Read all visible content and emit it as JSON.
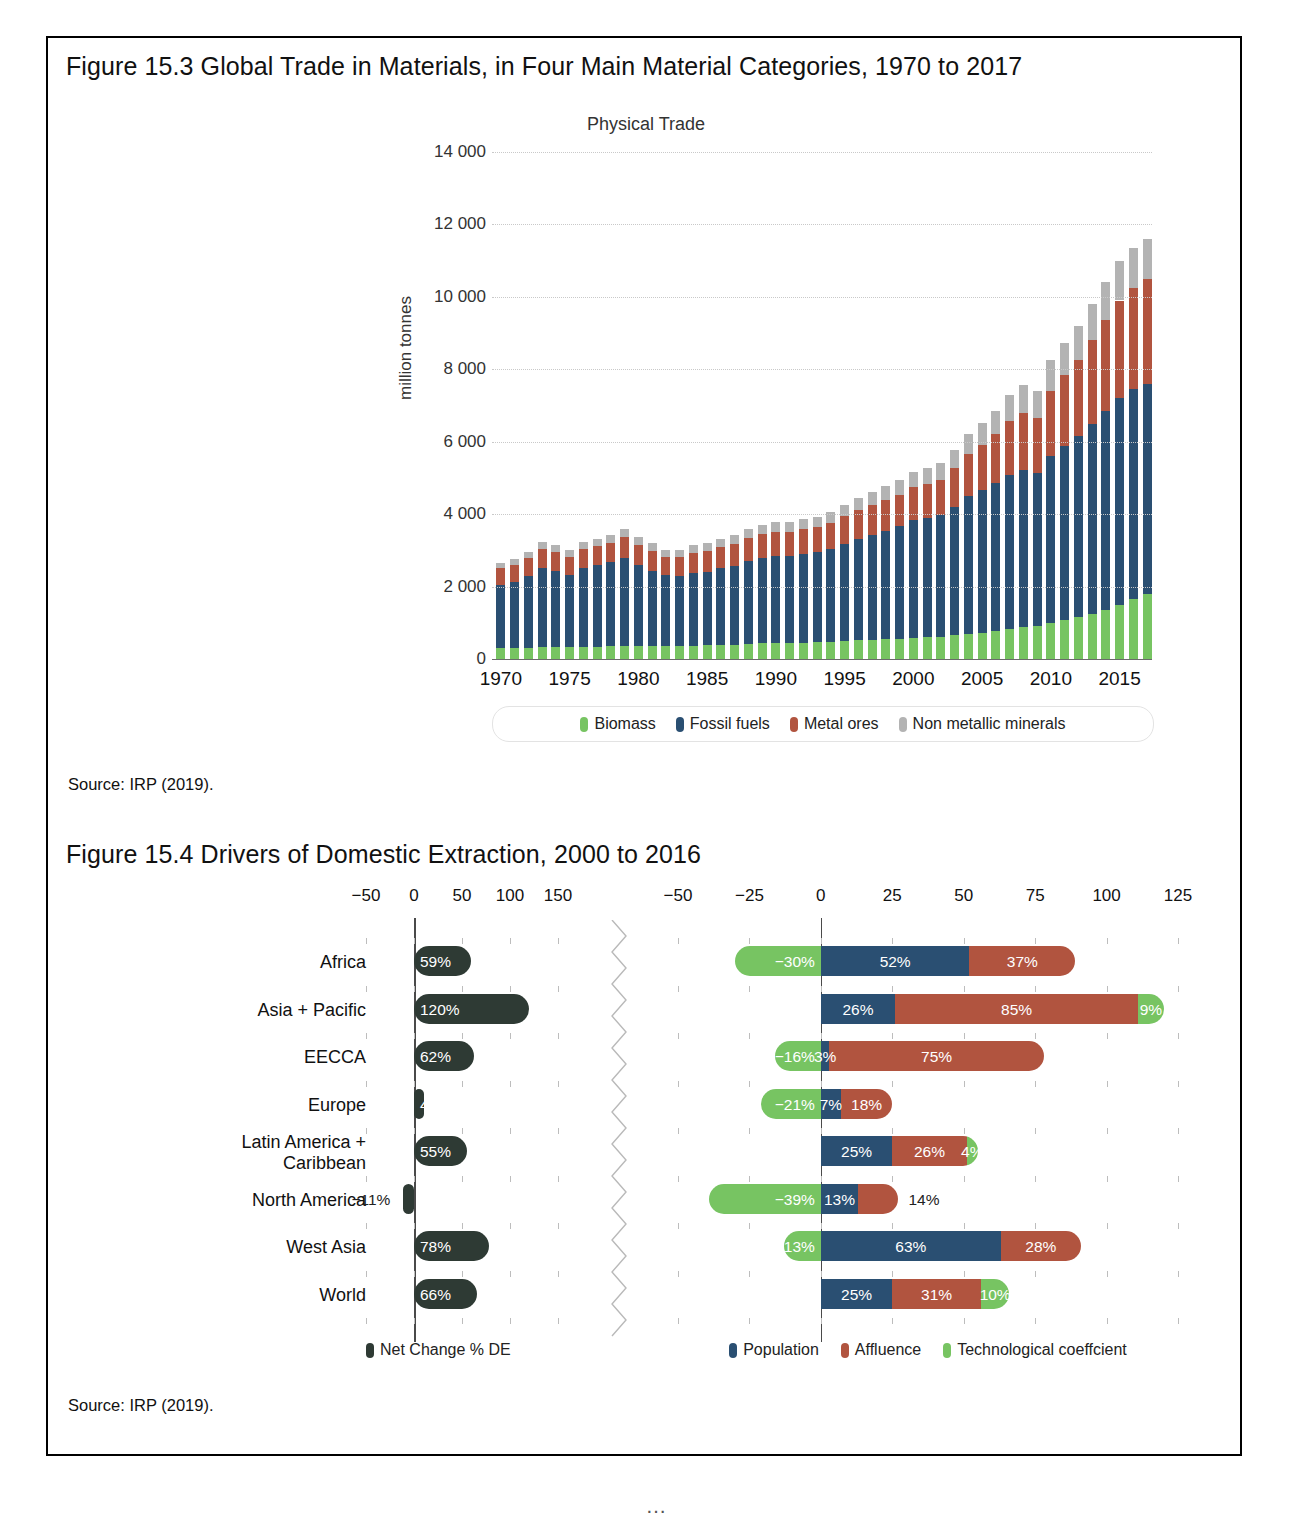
{
  "figure_3": {
    "title": "Figure 15.3  Global Trade in Materials, in Four Main Material Categories, 1970 to 2017",
    "source": "Source: IRP (2019)."
  },
  "figure_4": {
    "title": "Figure 15.4  Drivers of Domestic Extraction, 2000 to 2016",
    "source": "Source: IRP (2019)."
  },
  "chart_data": [
    {
      "type": "bar",
      "stacked": true,
      "title": "Physical Trade",
      "xlabel": "",
      "ylabel": "million tonnes",
      "ylim": [
        0,
        14000
      ],
      "yticks": [
        "0",
        "2 000",
        "4 000",
        "6 000",
        "8 000",
        "10 000",
        "12 000",
        "14 000"
      ],
      "xticks": [
        "1970",
        "1975",
        "1980",
        "1985",
        "1990",
        "1995",
        "2000",
        "2005",
        "2010",
        "2015"
      ],
      "grid": true,
      "legend_position": "bottom",
      "legend": [
        "Biomass",
        "Fossil fuels",
        "Metal ores",
        "Non metallic minerals"
      ],
      "colors": {
        "Biomass": "#77c462",
        "Fossil fuels": "#2a4f72",
        "Metal ores": "#b1543f",
        "Non metallic minerals": "#b3b3b3"
      },
      "x": [
        1970,
        1971,
        1972,
        1973,
        1974,
        1975,
        1976,
        1977,
        1978,
        1979,
        1980,
        1981,
        1982,
        1983,
        1984,
        1985,
        1986,
        1987,
        1988,
        1989,
        1990,
        1991,
        1992,
        1993,
        1994,
        1995,
        1996,
        1997,
        1998,
        1999,
        2000,
        2001,
        2002,
        2003,
        2004,
        2005,
        2006,
        2007,
        2008,
        2009,
        2010,
        2011,
        2012,
        2013,
        2014,
        2015,
        2016,
        2017
      ],
      "series": [
        {
          "name": "Biomass",
          "values": [
            300,
            305,
            315,
            330,
            325,
            320,
            335,
            345,
            355,
            365,
            360,
            355,
            350,
            355,
            370,
            375,
            390,
            400,
            420,
            430,
            440,
            450,
            455,
            465,
            480,
            500,
            515,
            530,
            545,
            560,
            580,
            600,
            620,
            650,
            690,
            720,
            760,
            820,
            880,
            900,
            1000,
            1080,
            1150,
            1250,
            1350,
            1500,
            1650,
            1800
          ]
        },
        {
          "name": "Fossil fuels",
          "values": [
            1750,
            1830,
            1980,
            2180,
            2100,
            2010,
            2180,
            2250,
            2320,
            2430,
            2230,
            2080,
            1960,
            1950,
            2000,
            2030,
            2120,
            2180,
            2280,
            2350,
            2400,
            2400,
            2450,
            2480,
            2560,
            2680,
            2800,
            2900,
            3000,
            3100,
            3250,
            3300,
            3350,
            3550,
            3800,
            3950,
            4100,
            4250,
            4350,
            4250,
            4600,
            4800,
            5000,
            5250,
            5500,
            5700,
            5800,
            5800
          ]
        },
        {
          "name": "Metal ores",
          "values": [
            450,
            470,
            490,
            520,
            520,
            480,
            510,
            520,
            540,
            570,
            560,
            540,
            500,
            510,
            550,
            570,
            580,
            600,
            640,
            660,
            670,
            670,
            680,
            690,
            720,
            760,
            790,
            830,
            850,
            880,
            920,
            940,
            980,
            1080,
            1180,
            1250,
            1350,
            1500,
            1550,
            1500,
            1800,
            1950,
            2100,
            2300,
            2500,
            2700,
            2800,
            2900
          ]
        },
        {
          "name": "Non metallic minerals",
          "values": [
            160,
            170,
            180,
            200,
            200,
            190,
            200,
            210,
            220,
            230,
            225,
            215,
            205,
            205,
            215,
            220,
            230,
            240,
            250,
            260,
            270,
            270,
            280,
            290,
            300,
            320,
            340,
            360,
            380,
            400,
            420,
            430,
            450,
            500,
            550,
            600,
            650,
            720,
            780,
            760,
            850,
            900,
            950,
            1000,
            1050,
            1080,
            1100,
            1100
          ]
        }
      ]
    },
    {
      "type": "bar",
      "orientation": "horizontal",
      "panel": "left",
      "title": "",
      "legend": [
        "Net Change % DE"
      ],
      "colors": {
        "Net Change % DE": "#2e3a34"
      },
      "xticks": [
        "-50",
        "0",
        "50",
        "100",
        "150"
      ],
      "xlim": [
        -50,
        150
      ],
      "categories": [
        "Africa",
        "Asia + Pacific",
        "EECCA",
        "Europe",
        "Latin America + Caribbean",
        "North America",
        "West Asia",
        "World"
      ],
      "values": [
        59,
        120,
        62,
        4,
        55,
        -11,
        78,
        66
      ],
      "labels": [
        "59%",
        "120%",
        "62%",
        "4%",
        "55%",
        "-11%",
        "78%",
        "66%"
      ]
    },
    {
      "type": "bar",
      "orientation": "horizontal",
      "stacked": true,
      "panel": "right",
      "title": "",
      "legend": [
        "Population",
        "Affluence",
        "Technological coeffcient"
      ],
      "colors": {
        "Population": "#2a4f72",
        "Affluence": "#b1543f",
        "Technological coeffcient": "#77c462"
      },
      "xticks": [
        "-50",
        "-25",
        "0",
        "25",
        "50",
        "75",
        "100",
        "125"
      ],
      "xlim": [
        -50,
        125
      ],
      "categories": [
        "Africa",
        "Asia + Pacific",
        "EECCA",
        "Europe",
        "Latin America + Caribbean",
        "North America",
        "West Asia",
        "World"
      ],
      "series": [
        {
          "name": "Population",
          "values": [
            52,
            26,
            3,
            7,
            25,
            13,
            63,
            25
          ],
          "labels": [
            "52%",
            "26%",
            "3%",
            "7%",
            "25%",
            "13%",
            "63%",
            "25%"
          ]
        },
        {
          "name": "Affluence",
          "values": [
            37,
            85,
            75,
            18,
            26,
            14,
            28,
            31
          ],
          "labels": [
            "37%",
            "85%",
            "75%",
            "18%",
            "26%",
            "14%",
            "28%",
            "31%"
          ]
        },
        {
          "name": "Technological coeffcient",
          "values": [
            -30,
            9,
            -16,
            -21,
            4,
            -39,
            -13,
            10
          ],
          "labels": [
            "-30%",
            "9%",
            "-16%",
            "-21%",
            "4%",
            "-39%",
            "-13%",
            "10%"
          ]
        }
      ]
    }
  ],
  "page_footer": "…"
}
